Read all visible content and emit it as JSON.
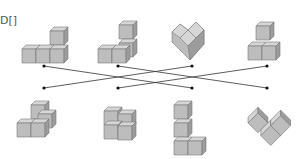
{
  "fragment_text": "D[]",
  "colors": {
    "cube_top": "#d8d8d8",
    "cube_left": "#b8b8b8",
    "cube_right": "#9a9a9a",
    "edge": "#777777",
    "line": "#333333",
    "dot": "#111111"
  },
  "top_row": [
    {
      "label": "view-1",
      "dot": [
        44,
        66
      ]
    },
    {
      "label": "view-2",
      "dot": [
        118,
        66
      ]
    },
    {
      "label": "view-3",
      "dot": [
        192,
        66
      ]
    },
    {
      "label": "view-4",
      "dot": [
        267,
        66
      ]
    }
  ],
  "bottom_row": [
    {
      "label": "solid-1",
      "dot": [
        44,
        88
      ]
    },
    {
      "label": "solid-2",
      "dot": [
        118,
        88
      ]
    },
    {
      "label": "solid-3",
      "dot": [
        192,
        88
      ]
    },
    {
      "label": "solid-4",
      "dot": [
        267,
        88
      ]
    }
  ],
  "connections": [
    [
      0,
      2
    ],
    [
      1,
      3
    ],
    [
      2,
      0
    ],
    [
      3,
      1
    ]
  ]
}
